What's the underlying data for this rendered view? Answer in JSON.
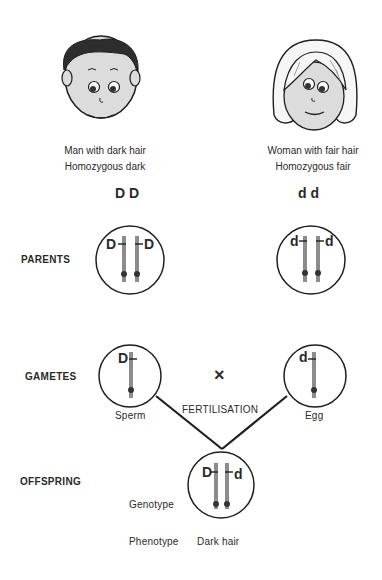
{
  "parents": {
    "father": {
      "description": "Man with dark hair",
      "zygosity": "Homozygous dark",
      "genotype": "DD",
      "alleles": [
        "D",
        "D"
      ],
      "hair_color": "#2e2e2e"
    },
    "mother": {
      "description": "Woman with fair hair",
      "zygosity": "Homozygous fair",
      "genotype": "dd",
      "alleles": [
        "d",
        "d"
      ],
      "hair_color": "#f4f4f4"
    }
  },
  "rows": {
    "parents": "PARENTS",
    "gametes": "GAMETES",
    "offspring": "OFFSPRING"
  },
  "gametes": {
    "sperm": {
      "label": "Sperm",
      "allele": "D"
    },
    "egg": {
      "label": "Egg",
      "allele": "d"
    },
    "cross_symbol": "×",
    "fertilisation_label": "FERTILISATION"
  },
  "offspring": {
    "alleles": [
      "D",
      "d"
    ],
    "genotype_label": "Genotype",
    "phenotype_label": "Phenotype",
    "phenotype_value": "Dark hair"
  },
  "colors": {
    "line": "#1e1e1e",
    "chromosome": "#8c8c8c",
    "skin": "#dcdcdc"
  }
}
